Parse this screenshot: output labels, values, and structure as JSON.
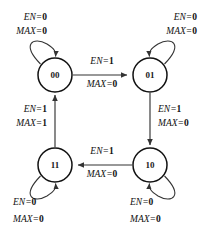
{
  "diagram": {
    "colors": {
      "background": "#ffffff",
      "stroke": "#333333",
      "state_stroke": "#111111",
      "text": "#111111"
    },
    "signals": {
      "enable": "EN",
      "max": "MAX"
    },
    "states": [
      {
        "id": "s00",
        "label": "00",
        "cx": 55,
        "cy": 75,
        "r": 17
      },
      {
        "id": "s01",
        "label": "01",
        "cx": 150,
        "cy": 75,
        "r": 17
      },
      {
        "id": "s11",
        "label": "11",
        "cx": 55,
        "cy": 165,
        "r": 17
      },
      {
        "id": "s10",
        "label": "10",
        "cx": 150,
        "cy": 165,
        "r": 17
      }
    ],
    "transitions": [
      {
        "id": "t-00-01",
        "from": "00",
        "to": "01",
        "direction": "right",
        "en_label": "EN=",
        "en_var": "EN",
        "en_eq": "=",
        "en_value": "1",
        "max_var": "MAX",
        "max_eq": "=",
        "max_value": "0",
        "label_x": 102,
        "label_y_en": 63,
        "label_y_max": 77
      },
      {
        "id": "t-01-10",
        "from": "01",
        "to": "10",
        "direction": "down",
        "en_var": "EN",
        "en_eq": "=",
        "en_value": "1",
        "max_var": "MAX",
        "max_eq": "=",
        "max_value": "0",
        "label_x": 158,
        "label_y_en": 112,
        "label_y_max": 126
      },
      {
        "id": "t-10-11",
        "from": "10",
        "to": "11",
        "direction": "left",
        "en_var": "EN",
        "en_eq": "=",
        "en_value": "1",
        "max_var": "MAX",
        "max_eq": "=",
        "max_value": "0",
        "label_x": 102,
        "label_y_en": 153,
        "label_y_max": 167
      },
      {
        "id": "t-11-00",
        "from": "11",
        "to": "00",
        "direction": "up",
        "en_var": "EN",
        "en_eq": "=",
        "en_value": "1",
        "max_var": "MAX",
        "max_eq": "=",
        "max_value": "1",
        "label_x": 45,
        "label_y_en": 112,
        "label_y_max": 126
      }
    ],
    "self_loops": [
      {
        "id": "loop-00",
        "state": "00",
        "corner": "top-left",
        "en_var": "EN",
        "en_eq": "=",
        "en_value": "0",
        "max_var": "MAX",
        "max_eq": "=",
        "max_value": "0",
        "label_x": 47,
        "label_y_en": 20,
        "label_y_max": 34
      },
      {
        "id": "loop-01",
        "state": "01",
        "corner": "top-right",
        "en_var": "EN",
        "en_eq": "=",
        "en_value": "0",
        "max_var": "MAX",
        "max_eq": "=",
        "max_value": "0",
        "label_x": 197,
        "label_y_en": 20,
        "label_y_max": 34
      },
      {
        "id": "loop-11",
        "state": "11",
        "corner": "bottom-left",
        "en_var": "EN",
        "en_eq": "=",
        "en_value": "0",
        "max_var": "MAX",
        "max_eq": "=",
        "max_value": "0",
        "label_x": 13,
        "label_y_en": 205,
        "label_y_max": 222
      },
      {
        "id": "loop-10",
        "state": "10",
        "corner": "bottom-right",
        "en_var": "EN",
        "en_eq": "=",
        "en_value": "0",
        "max_var": "MAX",
        "max_eq": "=",
        "max_value": "0",
        "label_x": 130,
        "label_y_en": 205,
        "label_y_max": 222
      }
    ]
  }
}
